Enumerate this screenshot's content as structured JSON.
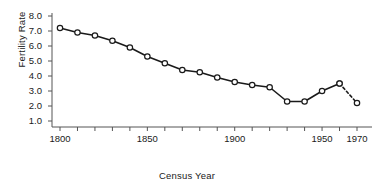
{
  "chart_data": {
    "type": "line",
    "title": "",
    "xlabel": "Census Year",
    "ylabel": "Fertility Rate",
    "xlim": [
      1795,
      1972
    ],
    "ylim": [
      0.6,
      8.2
    ],
    "grid": false,
    "legend": null,
    "x_tick_labels": [
      "1800",
      "1850",
      "1900",
      "1950",
      "1970"
    ],
    "x_tick_values": [
      1800,
      1850,
      1900,
      1950,
      1970
    ],
    "x_minor_ticks": [
      1800,
      1810,
      1820,
      1830,
      1840,
      1850,
      1860,
      1870,
      1880,
      1890,
      1900,
      1910,
      1920,
      1930,
      1940,
      1950,
      1960,
      1970
    ],
    "y_tick_labels": [
      "1.0",
      "2.0",
      "3.0",
      "4.0",
      "5.0",
      "6.0",
      "7.0",
      "8.0"
    ],
    "y_tick_values": [
      1.0,
      2.0,
      3.0,
      4.0,
      5.0,
      6.0,
      7.0,
      8.0
    ],
    "marker": "open-circle",
    "line_color": "#1a1a1a",
    "marker_face_color": "#ffffff",
    "series": [
      {
        "name": "Fertility Rate",
        "style": "solid",
        "x": [
          1800,
          1810,
          1820,
          1830,
          1840,
          1850,
          1860,
          1870,
          1880,
          1890,
          1900,
          1910,
          1920,
          1930,
          1940,
          1950,
          1960
        ],
        "values": [
          7.2,
          6.9,
          6.7,
          6.35,
          5.9,
          5.3,
          4.85,
          4.4,
          4.25,
          3.9,
          3.6,
          3.4,
          3.25,
          2.3,
          2.3,
          3.0,
          3.5
        ]
      },
      {
        "name": "Fertility Rate (projected)",
        "style": "dashed",
        "x": [
          1960,
          1970
        ],
        "values": [
          3.5,
          2.2
        ]
      }
    ]
  }
}
